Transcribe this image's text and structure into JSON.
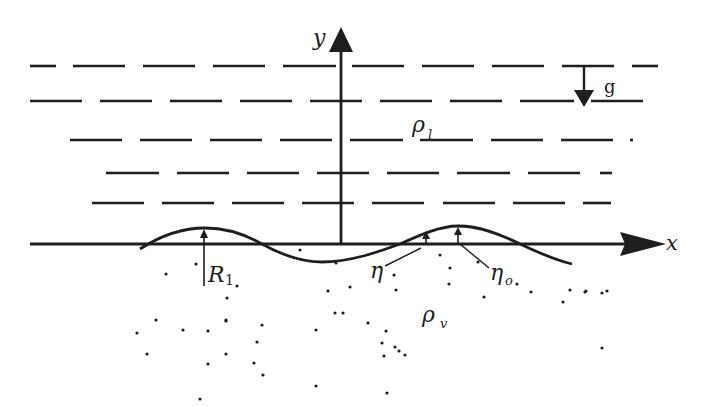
{
  "figure": {
    "colors": {
      "ink": "#1e1e1e",
      "background": "#ffffff"
    }
  },
  "axes": {
    "x_label": "x",
    "y_label": "y"
  },
  "gravity": {
    "label": "g",
    "direction": "down"
  },
  "regions": {
    "upper": {
      "symbol": "ρ",
      "subscript": "l",
      "meaning": "liquid density"
    },
    "lower": {
      "symbol": "ρ",
      "subscript": "v",
      "meaning": "vapor density"
    }
  },
  "annotations": {
    "R1": {
      "symbol": "R",
      "subscript": "1"
    },
    "eta": {
      "symbol": "η"
    },
    "eta0": {
      "symbol": "η",
      "subscript": "o"
    }
  },
  "dashed_rows": [
    {
      "y": 66,
      "segments": [
        [
          30,
          56
        ],
        [
          73,
          125
        ],
        [
          143,
          195
        ],
        [
          213,
          265
        ],
        [
          283,
          336
        ],
        [
          352,
          404
        ],
        [
          422,
          474
        ],
        [
          492,
          544
        ],
        [
          562,
          614
        ],
        [
          632,
          658
        ]
      ]
    },
    {
      "y": 101,
      "segments": [
        [
          30,
          82
        ],
        [
          100,
          152
        ],
        [
          170,
          222
        ],
        [
          240,
          292
        ],
        [
          310,
          362
        ],
        [
          380,
          432
        ],
        [
          450,
          502
        ],
        [
          520,
          574
        ],
        [
          591,
          643
        ]
      ]
    },
    {
      "y": 140,
      "segments": [
        [
          70,
          122
        ],
        [
          140,
          192
        ],
        [
          210,
          262
        ],
        [
          280,
          332
        ],
        [
          350,
          403
        ],
        [
          420,
          473
        ],
        [
          491,
          543
        ],
        [
          561,
          613
        ],
        [
          630,
          633
        ]
      ]
    },
    {
      "y": 173,
      "segments": [
        [
          106,
          159
        ],
        [
          177,
          229
        ],
        [
          247,
          299
        ],
        [
          317,
          369
        ],
        [
          387,
          439
        ],
        [
          457,
          510
        ],
        [
          528,
          580
        ],
        [
          600,
          612
        ]
      ]
    },
    {
      "y": 203,
      "segments": [
        [
          92,
          144
        ],
        [
          162,
          214
        ],
        [
          232,
          284
        ],
        [
          302,
          354
        ],
        [
          372,
          424
        ],
        [
          443,
          495
        ],
        [
          513,
          565
        ],
        [
          583,
          611
        ]
      ]
    }
  ],
  "particles": [
    [
      166,
      274
    ],
    [
      237,
      286
    ],
    [
      227,
      298
    ],
    [
      226,
      321
    ],
    [
      156,
      320
    ],
    [
      183,
      330
    ],
    [
      137,
      333
    ],
    [
      226,
      320
    ],
    [
      147,
      354
    ],
    [
      208,
      331
    ],
    [
      262,
      325
    ],
    [
      257,
      342
    ],
    [
      208,
      364
    ],
    [
      226,
      354
    ],
    [
      254,
      363
    ],
    [
      263,
      375
    ],
    [
      300,
      250
    ],
    [
      328,
      291
    ],
    [
      335,
      313
    ],
    [
      336,
      263
    ],
    [
      316,
      330
    ],
    [
      343,
      313
    ],
    [
      350,
      287
    ],
    [
      368,
      323
    ],
    [
      386,
      331
    ],
    [
      382,
      343
    ],
    [
      316,
      386
    ],
    [
      380,
      267
    ],
    [
      384,
      356
    ],
    [
      394,
      275
    ],
    [
      396,
      290
    ],
    [
      395,
      347
    ],
    [
      399,
      351
    ],
    [
      405,
      355
    ],
    [
      387,
      393
    ],
    [
      449,
      284
    ],
    [
      450,
      268
    ],
    [
      484,
      297
    ],
    [
      517,
      284
    ],
    [
      531,
      292
    ],
    [
      570,
      290
    ],
    [
      478,
      262
    ],
    [
      440,
      255
    ],
    [
      585,
      292
    ],
    [
      586,
      291
    ],
    [
      602,
      293
    ],
    [
      607,
      291
    ],
    [
      602,
      348
    ],
    [
      563,
      302
    ],
    [
      200,
      399
    ],
    [
      196,
      264
    ]
  ]
}
